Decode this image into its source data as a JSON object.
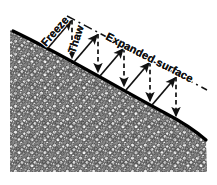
{
  "figure": {
    "kind": "cross-section-diagram",
    "width": 217,
    "height": 185,
    "background_color": "#ffffff"
  },
  "labels": {
    "freeze": "Freeze",
    "thaw": "Thaw",
    "expanded_surface": "Expanded surface"
  },
  "colors": {
    "ink": "#111111",
    "ground_line": "#000000",
    "clast_fill": "#d9d9d9",
    "clast_stroke": "#1a1a1a",
    "soil_background": "#6e6e6e",
    "background": "#ffffff"
  },
  "geometry": {
    "ground_surface_path": "M 13 31 C 60 53, 120 89, 165 113 C 186 124, 198 133, 206 140",
    "expanded_surface_path": "M 67 16 L 207 90",
    "soil_left_edge_x": 10,
    "soil_bottom_y": 172,
    "ground_line_width": 3.2,
    "slope_angle_degrees": 25
  },
  "arrows": {
    "freeze_label_note": "solid arrows, heave normal to the slope surface",
    "thaw_label_note": "dashed arrows, settlement vertically downward",
    "freeze_count": 5,
    "thaw_count": 5,
    "freeze_arrows": [
      {
        "x1": 48,
        "y1": 48,
        "x2": 72,
        "y2": 20
      },
      {
        "x1": 74,
        "y1": 62,
        "x2": 98,
        "y2": 34
      },
      {
        "x1": 100,
        "y1": 76,
        "x2": 124,
        "y2": 48
      },
      {
        "x1": 126,
        "y1": 90,
        "x2": 150,
        "y2": 62
      },
      {
        "x1": 152,
        "y1": 105,
        "x2": 176,
        "y2": 77
      }
    ],
    "thaw_arrows": [
      {
        "x1": 72,
        "y1": 20,
        "x2": 72,
        "y2": 60
      },
      {
        "x1": 98,
        "y1": 34,
        "x2": 98,
        "y2": 74
      },
      {
        "x1": 124,
        "y1": 48,
        "x2": 124,
        "y2": 88
      },
      {
        "x1": 150,
        "y1": 62,
        "x2": 150,
        "y2": 103
      },
      {
        "x1": 176,
        "y1": 77,
        "x2": 176,
        "y2": 118
      }
    ]
  },
  "label_placement": {
    "freeze": {
      "x": 46,
      "y": 47,
      "rotate": -49
    },
    "thaw": {
      "x": 75,
      "y": 53,
      "rotate": -72
    },
    "expanded": {
      "x": 106,
      "y": 43,
      "rotate": 27
    }
  }
}
